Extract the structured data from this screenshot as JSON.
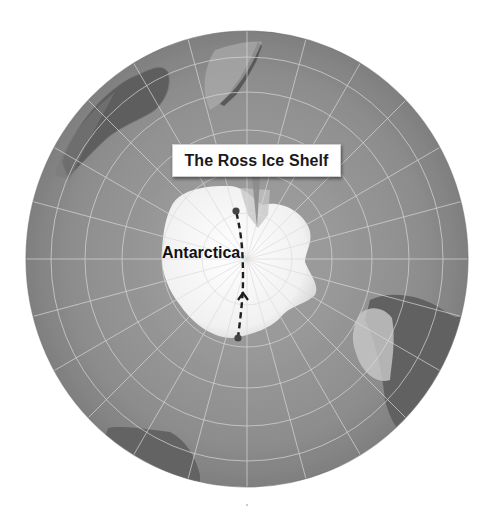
{
  "map": {
    "type": "polar-orthographic",
    "center": "South Pole",
    "callout": {
      "label": "The Ross Ice Shelf"
    },
    "place_labels": [
      {
        "label": "Antarctica"
      }
    ],
    "route": {
      "style": "dashed",
      "direction": "up",
      "start_point": "coast-opposite-ross",
      "end_point": "ross-ice-shelf"
    },
    "landmasses_visible": [
      "Antarctica",
      "Australia",
      "New Zealand",
      "South America",
      "Africa"
    ],
    "colors": {
      "ocean": "#8e8e8e",
      "ice": "#f4f4f4",
      "land_dark": "#5e5e5e",
      "graticule": "#d8d8d8",
      "route": "#222222"
    }
  }
}
